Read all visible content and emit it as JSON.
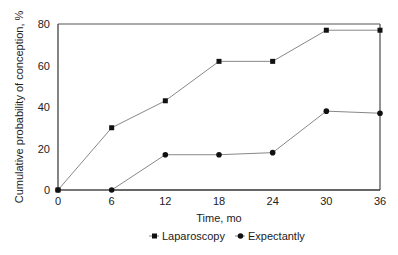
{
  "chart_data": {
    "type": "line",
    "title": "",
    "xlabel": "Time, mo",
    "ylabel": "Cumulative probability of conception, %",
    "x": [
      0,
      6,
      12,
      18,
      24,
      30,
      36
    ],
    "xticks": [
      0,
      6,
      12,
      18,
      24,
      30,
      36
    ],
    "yticks": [
      0,
      20,
      40,
      60,
      80
    ],
    "xlim": [
      0,
      36
    ],
    "ylim": [
      0,
      80
    ],
    "grid": false,
    "legend_position": "bottom",
    "series": [
      {
        "name": "Laparoscopy",
        "marker": "square",
        "values": [
          0,
          30,
          43,
          62,
          62,
          77,
          77
        ]
      },
      {
        "name": "Expectantly",
        "marker": "circle",
        "values": [
          0,
          0,
          17,
          17,
          18,
          38,
          37
        ]
      }
    ]
  },
  "colors": {
    "line": "#888888",
    "marker": "#111111",
    "axis": "#333333"
  }
}
